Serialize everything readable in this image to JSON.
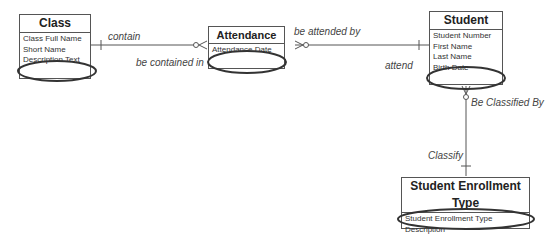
{
  "entities": {
    "class": {
      "title": "Class",
      "attributes": [
        "Class Full Name",
        "Short Name",
        "Description Text"
      ]
    },
    "attendance": {
      "title": "Attendance",
      "attributes": [
        "Attendance Date"
      ]
    },
    "student": {
      "title": "Student",
      "attributes": [
        "Student Number",
        "First Name",
        "Last Name",
        "Birth Date"
      ]
    },
    "enrollment_type": {
      "title": "Student Enrollment Type",
      "attributes": [
        "Student Enrollment Type",
        "Description"
      ]
    }
  },
  "relationships": {
    "class_attendance": {
      "forward": "contain",
      "reverse": "be contained in"
    },
    "attendance_student": {
      "forward": "be attended by",
      "reverse": "attend"
    },
    "student_type": {
      "forward": "Be Classified By",
      "reverse": "Classify"
    }
  },
  "colors": {
    "line": "#555555",
    "highlight": "#333333"
  }
}
